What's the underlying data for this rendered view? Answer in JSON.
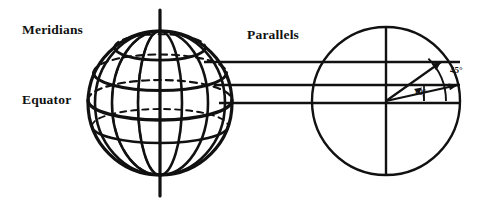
{
  "figure": {
    "background_color": "#ffffff",
    "stroke_color": "#111111"
  },
  "labels": {
    "meridians": "Meridians",
    "equator": "Equator",
    "parallels": "Parallels"
  },
  "angles": {
    "upper": "45°",
    "lower": "10°"
  },
  "globe": {
    "name": "wireframe-globe",
    "center_x": 160,
    "center_y": 103,
    "radius": 72,
    "axis_top_y": 10,
    "axis_bottom_y": 196,
    "meridian_count": 6,
    "parallel_count": 5
  },
  "circle": {
    "name": "cross-section-circle",
    "center_x": 386,
    "center_y": 101,
    "radius": 74
  },
  "connectors": {
    "name": "projection-lines",
    "count": 3,
    "y_values": [
      62,
      85,
      103
    ],
    "x_start": 232,
    "x_end": 460
  },
  "rays": [
    {
      "name": "ray-45",
      "angle_deg": 45,
      "label": "45°"
    },
    {
      "name": "ray-10",
      "angle_deg": 10,
      "label": "10°"
    }
  ]
}
